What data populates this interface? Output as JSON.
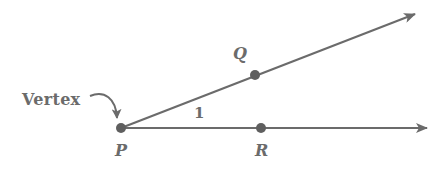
{
  "diagram": {
    "colors": {
      "stroke": "#6b6b6b",
      "point": "#5f5f5f",
      "text": "#6b6b6b"
    },
    "vertex_label": "Vertex",
    "angle_label": "1",
    "points": [
      {
        "name": "P",
        "x": 121,
        "y": 128,
        "label": "P"
      },
      {
        "name": "Q",
        "x": 255,
        "y": 75,
        "label": "Q"
      },
      {
        "name": "R",
        "x": 261,
        "y": 128,
        "label": "R"
      }
    ],
    "rays": [
      {
        "name": "ray-PQ",
        "from": "P",
        "through": "Q",
        "end": {
          "x": 415,
          "y": 14
        }
      },
      {
        "name": "ray-PR",
        "from": "P",
        "through": "R",
        "end": {
          "x": 427,
          "y": 128
        }
      }
    ]
  }
}
